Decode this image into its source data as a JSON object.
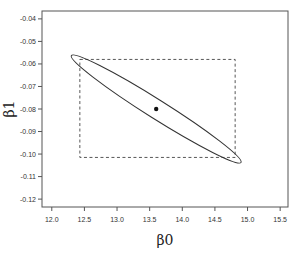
{
  "chart_data": {
    "type": "scatter",
    "title": "",
    "xlabel": "β0",
    "ylabel": "β1",
    "xlim": [
      11.85,
      15.62
    ],
    "ylim": [
      -0.1235,
      -0.0365
    ],
    "grid": false,
    "legend": null,
    "xticks": [
      12.0,
      12.5,
      13.0,
      13.5,
      14.0,
      14.5,
      15.0,
      15.5
    ],
    "xtick_labels": [
      "12.0",
      "12.5",
      "13.0",
      "13.5",
      "14.0",
      "14.5",
      "15.0",
      "15.5"
    ],
    "yticks": [
      -0.04,
      -0.05,
      -0.06,
      -0.07,
      -0.08,
      -0.09,
      -0.1,
      -0.11,
      -0.12
    ],
    "ytick_labels": [
      "-0.04",
      "-0.05",
      "-0.06",
      "-0.07",
      "-0.08",
      "-0.09",
      "-0.10",
      "-0.11",
      "-0.12"
    ],
    "point_estimate": {
      "x": 13.6,
      "y": -0.08
    },
    "confidence_ellipse": {
      "center": {
        "x": 13.6,
        "y": -0.08
      },
      "tip_upper_left": {
        "x": 12.32,
        "y": -0.0569
      },
      "tip_lower_right": {
        "x": 14.92,
        "y": -0.1043
      },
      "style": "solid"
    },
    "confidence_box": {
      "x_min": 12.43,
      "x_max": 14.81,
      "y_min": -0.1015,
      "y_max": -0.058,
      "style": "dashed"
    }
  }
}
